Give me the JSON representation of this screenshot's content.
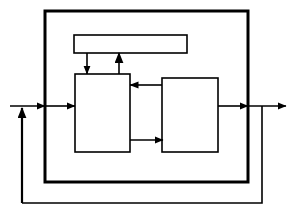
{
  "diagram": {
    "background_color": "#ffffff",
    "stroke_color": "#000000",
    "fill_color": "#ffffff",
    "canvas": {
      "width": 295,
      "height": 216
    },
    "nodes": [
      {
        "id": "outer-boundary",
        "name": "outer-system-boundary",
        "label": "",
        "shape": "rectangle",
        "x": 45,
        "y": 11,
        "width": 203,
        "height": 171,
        "stroke_width": 3
      },
      {
        "id": "top-block",
        "name": "top-block",
        "label": "",
        "shape": "rectangle",
        "x": 74,
        "y": 35,
        "width": 113,
        "height": 18,
        "stroke_width": 1.5
      },
      {
        "id": "left-block",
        "name": "left-block",
        "label": "",
        "shape": "rectangle",
        "x": 75,
        "y": 74,
        "width": 55,
        "height": 78,
        "stroke_width": 1.5
      },
      {
        "id": "right-block",
        "name": "right-block",
        "label": "",
        "shape": "rectangle",
        "x": 162,
        "y": 78,
        "width": 56,
        "height": 74,
        "stroke_width": 1.5
      }
    ],
    "connectors": [
      {
        "id": "input-arrow",
        "name": "input-arrow",
        "label": "",
        "from": "external-input",
        "to": "outer-boundary",
        "direction": "right",
        "points": "10,106 45,106",
        "arrowhead": "end"
      },
      {
        "id": "boundary-to-left-block",
        "name": "boundary-to-left-block-arrow",
        "label": "",
        "from": "outer-boundary",
        "to": "left-block",
        "direction": "right",
        "points": "45,106 75,106",
        "arrowhead": "end"
      },
      {
        "id": "feedback-riser-arrow",
        "name": "feedback-summing-arrow",
        "label": "",
        "from": "feedback-loop",
        "to": "input-arrow",
        "direction": "up",
        "points": "22,203 22,106",
        "arrowhead": "end"
      },
      {
        "id": "top-block-to-left-block",
        "name": "top-block-to-left-block-arrow",
        "label": "",
        "from": "top-block",
        "to": "left-block",
        "direction": "down",
        "points": "87,53 87,74",
        "arrowhead": "end"
      },
      {
        "id": "left-block-to-top-block",
        "name": "left-block-to-top-block-arrow",
        "label": "",
        "from": "left-block",
        "to": "top-block",
        "direction": "up",
        "points": "119,74 119,53",
        "arrowhead": "end"
      },
      {
        "id": "right-block-to-left-block",
        "name": "right-block-to-left-block-arrow",
        "label": "",
        "from": "right-block",
        "to": "left-block",
        "direction": "left",
        "points": "162,85 130,85",
        "arrowhead": "end"
      },
      {
        "id": "left-block-to-right-block",
        "name": "left-block-to-right-block-arrow",
        "label": "",
        "from": "left-block",
        "to": "right-block",
        "direction": "right",
        "points": "130,140 162,140",
        "arrowhead": "end"
      },
      {
        "id": "right-block-to-boundary",
        "name": "right-block-to-boundary-arrow",
        "label": "",
        "from": "right-block",
        "to": "outer-boundary",
        "direction": "right",
        "points": "218,106 248,106",
        "arrowhead": "end"
      },
      {
        "id": "output-arrow",
        "name": "output-arrow",
        "label": "",
        "from": "outer-boundary",
        "to": "external-output",
        "direction": "right",
        "points": "248,106 285,106",
        "arrowhead": "end"
      },
      {
        "id": "feedback-loop",
        "name": "feedback-loop-path",
        "label": "",
        "from": "output-arrow",
        "to": "feedback-summing-arrow",
        "direction": "counterclockwise",
        "points": "262,106 262,203 22,203",
        "arrowhead": "none"
      }
    ]
  }
}
